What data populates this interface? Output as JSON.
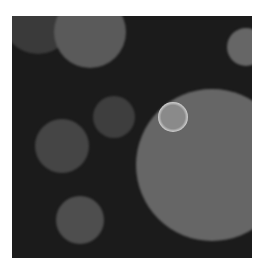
{
  "image": {
    "description": "Grayscale micrograph of circular droplets on dark background",
    "background_color": "#1b1b1b",
    "frame": {
      "x": 12,
      "y": 16,
      "width": 240,
      "height": 242
    },
    "blobs": [
      {
        "name": "blob-top-left-faint",
        "cx": 26,
        "cy": 2,
        "r": 36,
        "inner": "#3a3a3a",
        "edge": "#2c2c2c"
      },
      {
        "name": "blob-top",
        "cx": 78,
        "cy": 16,
        "r": 36,
        "inner": "#5a5a5a",
        "edge": "#7a7a7a"
      },
      {
        "name": "blob-right-edge",
        "cx": 234,
        "cy": 31,
        "r": 19,
        "inner": "#666666",
        "edge": "#7a7a7a"
      },
      {
        "name": "blob-mid-small",
        "cx": 102,
        "cy": 101,
        "r": 21,
        "inner": "#3e3e3e",
        "edge": "#4c4c4c"
      },
      {
        "name": "blob-left-medium",
        "cx": 50,
        "cy": 130,
        "r": 27,
        "inner": "#454545",
        "edge": "#575757"
      },
      {
        "name": "blob-large",
        "cx": 200,
        "cy": 149,
        "r": 76,
        "inner": "#666666",
        "edge": "#878787"
      },
      {
        "name": "blob-bottom",
        "cx": 68,
        "cy": 204,
        "r": 24,
        "inner": "#4e4e4e",
        "edge": "#5e5e5e"
      }
    ],
    "rings": [
      {
        "name": "bright-ring",
        "cx": 161,
        "cy": 101,
        "r": 15,
        "color": "#d8d8d8",
        "inner": "#8a8a8a"
      }
    ]
  }
}
